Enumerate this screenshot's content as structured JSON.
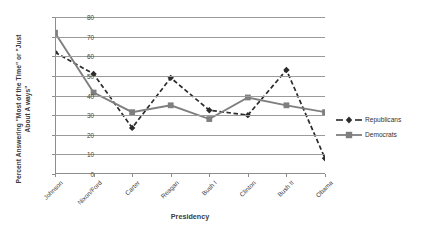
{
  "chart_data": {
    "type": "line",
    "title": "",
    "xlabel": "Presidency",
    "ylabel": "Percent Answering \"Most of the Time\" or \"Just About A ways\"",
    "ylabel_line1": "Percent Answering \"Most of the Time\" or \"Just",
    "ylabel_line2": "About A ways\"",
    "categories": [
      "Johnson",
      "Nixon/Ford",
      "Carter",
      "Reagan",
      "Bush I",
      "Clinton",
      "Bush II",
      "Obama"
    ],
    "series": [
      {
        "name": "Republicans",
        "values": [
          62,
          51,
          23.5,
          49,
          32.5,
          30,
          53,
          8
        ],
        "color": "#2b2b2b",
        "style": "dashed",
        "marker": "diamond"
      },
      {
        "name": "Democrats",
        "values": [
          72,
          41.5,
          31.5,
          35,
          28,
          39,
          35,
          31.5
        ],
        "color": "#7f7f7f",
        "style": "solid",
        "marker": "square"
      }
    ],
    "ylim": [
      0,
      80
    ],
    "yticks": [
      0,
      10,
      20,
      30,
      40,
      50,
      60,
      70,
      80
    ],
    "ytick_labels": [
      "0",
      "10",
      "20",
      "30",
      "40",
      "50",
      "60",
      "70",
      "80"
    ],
    "grid": true,
    "legend_position": "right",
    "gridline_color": "#9a9a9a",
    "background": "#ffffff"
  },
  "legend": {
    "items": [
      {
        "label": "Republicans"
      },
      {
        "label": "Democrats"
      }
    ]
  }
}
